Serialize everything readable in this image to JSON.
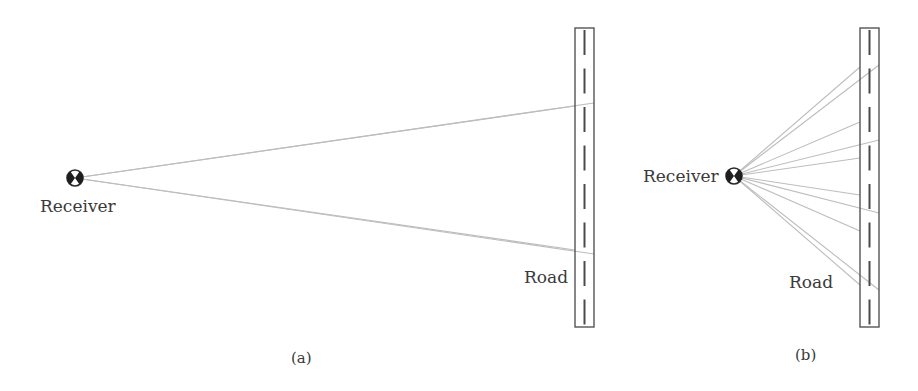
{
  "panel_a": {
    "caption": "(a)",
    "receiver_label": "Receiver",
    "road_label": "Road",
    "receiver": {
      "x": 75,
      "y": 178
    },
    "road": {
      "x1": 575,
      "x2": 594,
      "y1": 28,
      "y2": 327
    },
    "rays": [
      {
        "x": 594,
        "y": 103
      },
      {
        "x": 575,
        "y": 106
      },
      {
        "x": 575,
        "y": 250
      },
      {
        "x": 594,
        "y": 254
      }
    ]
  },
  "panel_b": {
    "caption": "(b)",
    "receiver_label": "Receiver",
    "road_label": "Road",
    "receiver": {
      "x": 734,
      "y": 176
    },
    "road": {
      "x1": 860,
      "x2": 879,
      "y1": 28,
      "y2": 327
    },
    "rays": [
      {
        "x": 860,
        "y": 67
      },
      {
        "x": 879,
        "y": 65
      },
      {
        "x": 860,
        "y": 122
      },
      {
        "x": 879,
        "y": 140
      },
      {
        "x": 860,
        "y": 158
      },
      {
        "x": 860,
        "y": 195
      },
      {
        "x": 879,
        "y": 213
      },
      {
        "x": 860,
        "y": 231
      },
      {
        "x": 860,
        "y": 285
      },
      {
        "x": 879,
        "y": 290
      }
    ]
  },
  "colors": {
    "ray": "#bdbdbd",
    "road_edge": "#555555",
    "dash": "#4a4a4a",
    "text": "#3a3a3a"
  }
}
